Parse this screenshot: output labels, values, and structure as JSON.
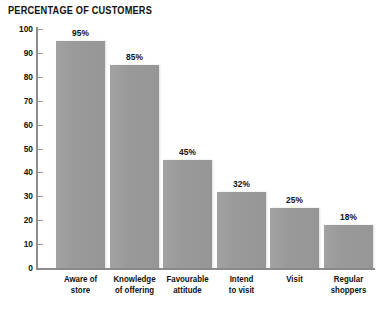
{
  "chart_data": {
    "type": "bar",
    "title": "PERCENTAGE OF CUSTOMERS",
    "xlabel": "",
    "ylabel": "",
    "ylim": [
      0,
      100
    ],
    "yticks": [
      0,
      10,
      20,
      30,
      40,
      50,
      60,
      70,
      80,
      90,
      100
    ],
    "ytick_labels": [
      "0",
      "10",
      "20",
      "30",
      "40",
      "50",
      "60",
      "70",
      "80",
      "90",
      "100"
    ],
    "grid": false,
    "legend": null,
    "bar_color": "#9a9a9a",
    "background_color": "#ffffff",
    "axis_color": "#8d8d8d",
    "categories": [
      "Aware of\nstore",
      "Knowledge\nof offering",
      "Favourable\nattitude",
      "Intend\nto visit",
      "Visit",
      "Regular\nshoppers"
    ],
    "values": [
      95,
      85,
      45,
      32,
      25,
      18
    ],
    "value_labels": [
      "95%",
      "85%",
      "45%",
      "32%",
      "25%",
      "18%"
    ]
  }
}
